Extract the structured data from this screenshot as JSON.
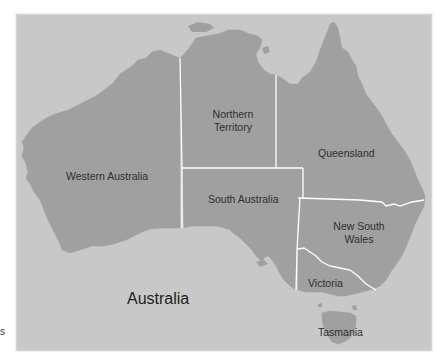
{
  "map": {
    "title": "Australia",
    "colors": {
      "background": "#ffffff",
      "sea": "#c8c8c8",
      "land": "#a0a0a0",
      "border": "#ffffff",
      "frame": "#e0e0e0",
      "text": "#2e2e2e"
    },
    "regions": [
      {
        "id": "wa",
        "name": "Western Australia",
        "label": "Western Australia"
      },
      {
        "id": "nt",
        "name": "Northern Territory",
        "label_line1": "Northern",
        "label_line2": "Territory"
      },
      {
        "id": "qld",
        "name": "Queensland",
        "label": "Queensland"
      },
      {
        "id": "sa",
        "name": "South Australia",
        "label": "South Australia"
      },
      {
        "id": "nsw",
        "name": "New South Wales",
        "label_line1": "New South",
        "label_line2": "Wales"
      },
      {
        "id": "vic",
        "name": "Victoria",
        "label": "Victoria"
      },
      {
        "id": "tas",
        "name": "Tasmania",
        "label": "Tasmania"
      }
    ],
    "stray_text": "s"
  }
}
